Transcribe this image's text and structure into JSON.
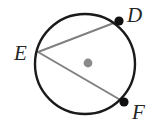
{
  "figure": {
    "kind": "circle-with-two-chords",
    "caption_points": [
      "D",
      "E",
      "F"
    ],
    "labels": {
      "d": "D",
      "e": "E",
      "f": "F"
    },
    "colors": {
      "background": "#ffffff",
      "circle_stroke": "#1a1a1a",
      "chord_stroke": "#808080",
      "point_fill": "#111111",
      "center_fill": "#8a8a8a",
      "label_fill": "#262626"
    },
    "circle": {
      "center_x": 85,
      "center_y": 64,
      "radius": 50,
      "stroke_width": 2.4
    },
    "center_marker": {
      "x": 88,
      "y": 63,
      "radius": 4.4
    },
    "points": [
      {
        "name": "D",
        "x": 119,
        "y": 21,
        "radius": 4.6,
        "label_x": 127,
        "label_y": 22
      },
      {
        "name": "E",
        "x": 38,
        "y": 52,
        "radius": 0,
        "label_x": 14,
        "label_y": 60
      },
      {
        "name": "F",
        "x": 124,
        "y": 102,
        "radius": 4.6,
        "label_x": 132,
        "label_y": 119
      }
    ],
    "chords": [
      {
        "name": "chord-ED",
        "x1": 38,
        "y1": 52,
        "x2": 119,
        "y2": 21,
        "stroke_width": 2.0
      },
      {
        "name": "chord-EF",
        "x1": 38,
        "y1": 52,
        "x2": 124,
        "y2": 102,
        "stroke_width": 2.0
      }
    ]
  }
}
